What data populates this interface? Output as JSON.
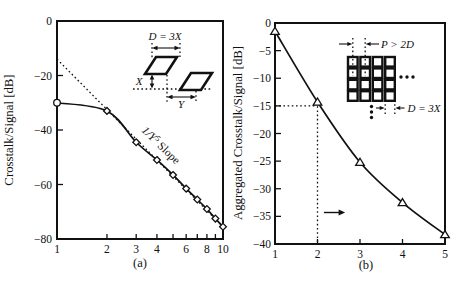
{
  "chart_data": [
    {
      "id": "a",
      "type": "line",
      "panel_label": "(a)",
      "ylabel": "Crosstalk/Signal [dB]",
      "xlabel": "",
      "xscale": "log",
      "xlim": [
        1,
        10
      ],
      "ylim": [
        -80,
        0
      ],
      "xtick_labels": [
        1,
        2,
        3,
        4,
        6,
        8,
        10
      ],
      "xtick_marks": [
        2,
        3,
        4,
        5,
        6,
        7,
        8,
        9
      ],
      "ytick_labels": [
        0,
        -20,
        -40,
        -60,
        -80
      ],
      "grid": false,
      "series": [
        {
          "name": "crosstalk-vs-separation",
          "marker": "diamond",
          "marker_first": "circle",
          "x": [
            1,
            2,
            3,
            4,
            5,
            6,
            7,
            8,
            9,
            10
          ],
          "y": [
            -30,
            -33,
            -44.5,
            -51,
            -56.5,
            -61.5,
            -65.5,
            -69,
            -72.5,
            -75.5
          ]
        }
      ],
      "asymptote": {
        "x1": 1,
        "y1": -14,
        "x2": 10,
        "y2": -75.5,
        "style": "dotted"
      },
      "slope_label": {
        "prefix": "1/Y",
        "sup": "5",
        "suffix": " Slope"
      },
      "inset": {
        "d_label": "D = 3X",
        "x_label": "X",
        "y_label": "Y"
      }
    },
    {
      "id": "b",
      "type": "line",
      "panel_label": "(b)",
      "ylabel": "Aggregated Crosstalk/Signal [dB]",
      "xlabel": "",
      "xscale": "linear",
      "xlim": [
        1,
        5
      ],
      "ylim": [
        -40,
        0
      ],
      "xtick_labels": [
        1,
        2,
        3,
        4,
        5
      ],
      "xtick_marks": [
        2,
        3,
        4
      ],
      "ytick_labels": [
        0,
        -5,
        -10,
        -15,
        -20,
        -25,
        -30,
        -35,
        -40
      ],
      "grid": false,
      "series": [
        {
          "name": "aggregated-crosstalk",
          "marker": "triangle",
          "x": [
            1,
            2,
            3,
            4,
            5
          ],
          "y": [
            -1.5,
            -14.3,
            -25.2,
            -32.5,
            -38.3
          ]
        }
      ],
      "guides": {
        "x": 2,
        "y": -15,
        "style": "dotted"
      },
      "arrow": {
        "x1": 2.15,
        "x2": 2.65,
        "y": -34.3,
        "direction": "right"
      },
      "inset": {
        "p_label": "P > 2D",
        "d_label": "D = 3X"
      }
    }
  ]
}
